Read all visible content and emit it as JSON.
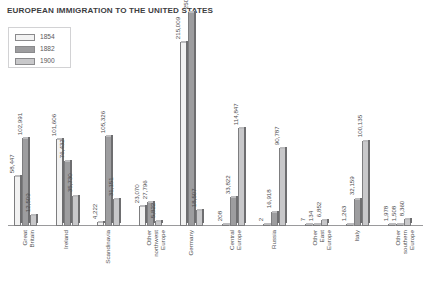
{
  "chart": {
    "title_text": "European immigration to the United States"
  },
  "legend": {
    "entries": [
      {
        "label": "1854",
        "color": "#f2f2f2"
      },
      {
        "label": "1882",
        "color": "#9d9d9f"
      },
      {
        "label": "1900",
        "color": "#c8c8ca"
      }
    ]
  },
  "chart_data": {
    "type": "bar",
    "title": "European immigration to the United States",
    "xlabel": "",
    "ylabel": "",
    "grid": false,
    "legend_position": "top-left",
    "ylim": [
      0,
      250630
    ],
    "categories": [
      "Great Britain",
      "Ireland",
      "Scandinavia",
      "Other northwest Europe",
      "Germany",
      "Central Europe",
      "Russia",
      "Other East Europe",
      "Italy",
      "Other southern Europe"
    ],
    "category_lines": [
      [
        "Great",
        "Britain"
      ],
      [
        "Ireland"
      ],
      [
        "Scandinavia"
      ],
      [
        "Other",
        "northwest",
        "Europe"
      ],
      [
        "Germany"
      ],
      [
        "Central",
        "Europe"
      ],
      [
        "Russia"
      ],
      [
        "Other",
        "East",
        "Europe"
      ],
      [
        "Italy"
      ],
      [
        "Other",
        "southern",
        "Europe"
      ]
    ],
    "series": [
      {
        "name": "1854",
        "color": "#f2f2f2",
        "values": [
          58447,
          101606,
          4222,
          23070,
          215009,
          208,
          2,
          7,
          1263,
          1978
        ],
        "labels": [
          "58,447",
          "101,606",
          "4,222",
          "23,070",
          "215,009",
          "208",
          "2",
          "7",
          "1,263",
          "1,978"
        ]
      },
      {
        "name": "1882",
        "color": "#9d9d9f",
        "values": [
          102991,
          76432,
          105326,
          27796,
          250630,
          33822,
          16918,
          134,
          32159,
          1508
        ],
        "labels": [
          "102,991",
          "76,432",
          "105,326",
          "27,796",
          "250,630",
          "33,822",
          "16,918",
          "134",
          "32,159",
          "1,508"
        ]
      },
      {
        "name": "1900",
        "color": "#c8c8ca",
        "values": [
          12509,
          35730,
          31151,
          5822,
          18507,
          114847,
          90787,
          6852,
          100135,
          8360
        ],
        "labels": [
          "12,509",
          "35,730",
          "31,151",
          "5,822",
          "18,507",
          "114,847",
          "90,787",
          "6,852",
          "100,135",
          "8,360"
        ]
      }
    ]
  }
}
